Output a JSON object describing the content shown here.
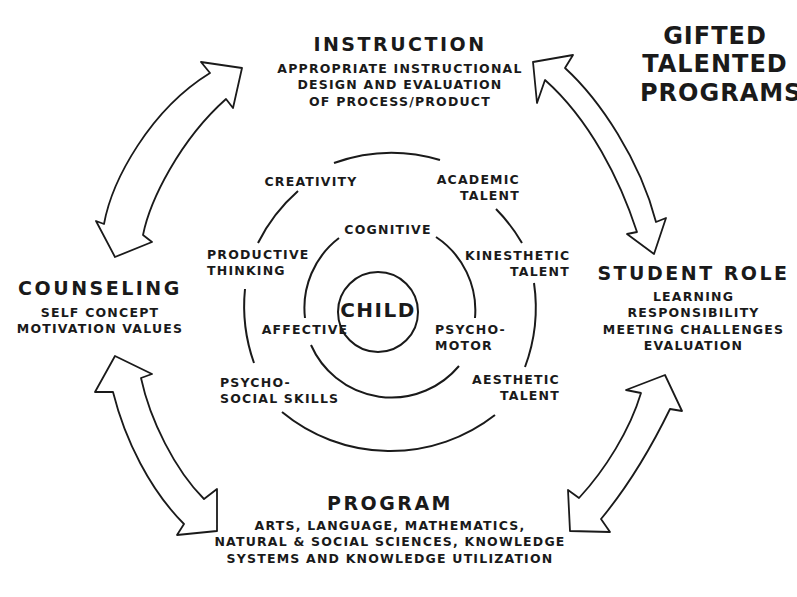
{
  "title": {
    "lines": [
      "GIFTED",
      "TALENTED",
      "PROGRAMS"
    ]
  },
  "center": {
    "label": "CHILD"
  },
  "inner_ring": {
    "nodes": [
      {
        "id": "cognitive",
        "lines": [
          "COGNITIVE"
        ]
      },
      {
        "id": "affective",
        "lines": [
          "AFFECTIVE"
        ]
      },
      {
        "id": "psychomotor",
        "lines": [
          "PSYCHO-",
          "MOTOR"
        ]
      }
    ]
  },
  "outer_ring": {
    "nodes": [
      {
        "id": "creativity",
        "lines": [
          "CREATIVITY"
        ]
      },
      {
        "id": "academic-talent",
        "lines": [
          "ACADEMIC",
          "TALENT"
        ]
      },
      {
        "id": "kinesthetic-talent",
        "lines": [
          "KINESTHETIC",
          "TALENT"
        ]
      },
      {
        "id": "aesthetic-talent",
        "lines": [
          "AESTHETIC",
          "TALENT"
        ]
      },
      {
        "id": "psycho-social-skills",
        "lines": [
          "PSYCHO-",
          "SOCIAL SKILLS"
        ]
      },
      {
        "id": "productive-thinking",
        "lines": [
          "PRODUCTIVE",
          "THINKING"
        ]
      }
    ]
  },
  "components": {
    "instruction": {
      "heading": "INSTRUCTION",
      "lines": [
        "APPROPRIATE INSTRUCTIONAL",
        "DESIGN AND EVALUATION",
        "OF PROCESS/PRODUCT"
      ]
    },
    "student_role": {
      "heading": "STUDENT ROLE",
      "lines": [
        "LEARNING",
        "RESPONSIBILITY",
        "MEETING  CHALLENGES",
        "EVALUATION"
      ]
    },
    "program": {
      "heading": "PROGRAM",
      "lines": [
        "ARTS, LANGUAGE, MATHEMATICS,",
        "NATURAL & SOCIAL SCIENCES, KNOWLEDGE",
        "SYSTEMS AND KNOWLEDGE UTILIZATION"
      ]
    },
    "counseling": {
      "heading": "COUNSELING",
      "lines": [
        "SELF CONCEPT",
        "MOTIVATION VALUES"
      ]
    }
  },
  "arrows": [
    {
      "id": "counseling-instruction",
      "type": "double-headed curved"
    },
    {
      "id": "instruction-student-role",
      "type": "double-headed curved"
    },
    {
      "id": "student-role-program",
      "type": "double-headed curved"
    },
    {
      "id": "program-counseling",
      "type": "double-headed curved"
    }
  ],
  "colors": {
    "ink": "#1a1a1a",
    "background": "#ffffff"
  }
}
